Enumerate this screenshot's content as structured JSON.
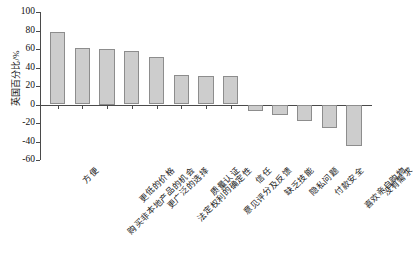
{
  "chart_data": {
    "type": "bar",
    "title": "",
    "subtitle": "",
    "xlabel": "",
    "ylabel": "英国百分比/%",
    "ylim": [
      -60,
      100
    ],
    "yticks": [
      100,
      80,
      60,
      40,
      20,
      0,
      -20,
      -40,
      -60
    ],
    "ytick_labels": [
      "100",
      "80",
      "60",
      "40",
      "20",
      "0",
      "-20",
      "-40",
      "-60"
    ],
    "grid": false,
    "legend": false,
    "legend_position": "none",
    "bar_fill_color": "#cdcdcd",
    "bar_edge_color": "#8d8d8d",
    "axis_color": "#4a4a4a",
    "categories": [
      "方便",
      "购买非本地产品的机会",
      "更低的价格",
      "更广泛的选择",
      "法定权利的确定性",
      "质量认证",
      "意见评分及反馈",
      "信任",
      "缺乏技能",
      "隐私问题",
      "付款安全",
      "喜欢亲自购物",
      "没有需求"
    ],
    "values": [
      78,
      61,
      60,
      58,
      51,
      32,
      31,
      31,
      -7,
      -11,
      -18,
      -25,
      -45
    ],
    "series": [
      {
        "name": "英国百分比",
        "values": [
          78,
          61,
          60,
          58,
          51,
          32,
          31,
          31,
          -7,
          -11,
          -18,
          -25,
          -45
        ]
      }
    ]
  }
}
